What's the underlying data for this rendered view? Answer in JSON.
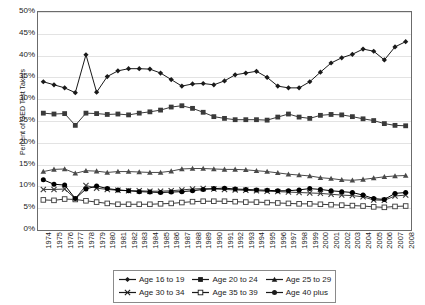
{
  "chart_data": {
    "type": "line",
    "title": "",
    "xlabel": "",
    "ylabel": "Percent of GED Test Takers",
    "ylim": [
      0,
      50
    ],
    "ytick_labels": [
      "50%",
      "45%",
      "40%",
      "35%",
      "30%",
      "25%",
      "20%",
      "15%",
      "10%",
      "5%",
      "0%"
    ],
    "ytick_values": [
      50,
      45,
      40,
      35,
      30,
      25,
      20,
      15,
      10,
      5,
      0
    ],
    "grid": true,
    "legend_position": "bottom",
    "x": [
      1974,
      1975,
      1976,
      1977,
      1978,
      1979,
      1980,
      1981,
      1982,
      1983,
      1984,
      1985,
      1986,
      1987,
      1988,
      1989,
      1990,
      1991,
      1992,
      1993,
      1994,
      1995,
      1996,
      1997,
      1998,
      1999,
      2000,
      2001,
      2002,
      2003,
      2004,
      2005,
      2006,
      2007,
      2008
    ],
    "categories": [
      "1974",
      "1975",
      "1976",
      "1977",
      "1978",
      "1979",
      "1980",
      "1981",
      "1982",
      "1983",
      "1984",
      "1985",
      "1986",
      "1987",
      "1988",
      "1989",
      "1990",
      "1991",
      "1992",
      "1993",
      "1994",
      "1995",
      "1996",
      "1997",
      "1998",
      "1999",
      "2000",
      "2001",
      "2002",
      "2003",
      "2004",
      "2005",
      "2006",
      "2007",
      "2008"
    ],
    "series": [
      {
        "name": "Age 16 to 19",
        "marker": "diamond",
        "color": "#1a1a1a",
        "values": [
          34.0,
          33.3,
          32.6,
          31.5,
          40.2,
          31.6,
          35.2,
          36.5,
          37.0,
          37.0,
          36.9,
          36.0,
          34.5,
          33.0,
          33.5,
          33.6,
          33.3,
          34.2,
          35.6,
          36.0,
          36.4,
          35.0,
          33.0,
          32.6,
          32.6,
          34.0,
          36.2,
          38.3,
          39.5,
          40.3,
          41.5,
          41.0,
          39.0,
          42.0,
          43.2
        ]
      },
      {
        "name": "Age 20 to 24",
        "marker": "square-filled",
        "color": "#3a3a3a",
        "values": [
          26.8,
          26.6,
          26.7,
          24.0,
          26.8,
          26.7,
          26.5,
          26.6,
          26.4,
          26.8,
          27.1,
          27.5,
          28.2,
          28.5,
          27.9,
          27.0,
          26.0,
          25.6,
          25.3,
          25.3,
          25.3,
          25.2,
          25.9,
          26.6,
          25.9,
          25.6,
          26.3,
          26.5,
          26.4,
          26.0,
          25.5,
          25.1,
          24.4,
          24.0,
          23.9
        ]
      },
      {
        "name": "Age 25 to 29",
        "marker": "triangle",
        "color": "#4a4a4a",
        "values": [
          13.4,
          13.9,
          14.0,
          13.0,
          13.6,
          13.5,
          13.2,
          13.4,
          13.4,
          13.3,
          13.2,
          13.2,
          13.5,
          14.0,
          14.1,
          14.1,
          14.0,
          13.9,
          13.9,
          13.8,
          13.6,
          13.4,
          13.1,
          12.8,
          12.6,
          12.4,
          12.0,
          11.8,
          11.5,
          11.4,
          11.6,
          11.9,
          12.2,
          12.4,
          12.5
        ]
      },
      {
        "name": "Age 30 to 34",
        "marker": "x",
        "color": "#3a3a3a",
        "values": [
          9.3,
          9.3,
          9.4,
          7.2,
          10.2,
          9.6,
          9.3,
          9.1,
          9.0,
          9.0,
          8.9,
          8.9,
          9.0,
          9.2,
          9.4,
          9.5,
          9.4,
          9.3,
          9.2,
          9.1,
          9.0,
          8.9,
          8.8,
          8.7,
          8.6,
          8.5,
          8.4,
          8.2,
          8.0,
          7.9,
          7.6,
          6.9,
          6.8,
          7.8,
          8.0
        ]
      },
      {
        "name": "Age 35 to 39",
        "marker": "square-open",
        "color": "#3a3a3a",
        "values": [
          6.9,
          6.8,
          7.1,
          7.0,
          6.7,
          6.4,
          6.1,
          5.9,
          5.9,
          5.9,
          5.9,
          6.0,
          6.1,
          6.3,
          6.5,
          6.6,
          6.6,
          6.6,
          6.5,
          6.4,
          6.4,
          6.3,
          6.2,
          6.1,
          6.0,
          6.0,
          5.9,
          5.8,
          5.7,
          5.6,
          5.5,
          5.3,
          5.2,
          5.4,
          5.5
        ]
      },
      {
        "name": "Age 40 plus",
        "marker": "circle",
        "color": "#000000",
        "values": [
          11.5,
          10.5,
          10.3,
          7.2,
          9.4,
          10.1,
          9.5,
          9.2,
          9.0,
          8.8,
          8.7,
          8.6,
          8.7,
          8.8,
          9.0,
          9.3,
          9.5,
          9.6,
          9.4,
          9.3,
          9.2,
          9.1,
          9.0,
          9.0,
          9.2,
          9.5,
          9.3,
          9.0,
          8.8,
          8.6,
          8.0,
          7.2,
          7.0,
          8.4,
          8.6
        ]
      }
    ]
  },
  "legend": {
    "rows": [
      [
        {
          "label": "Age 16 to 19",
          "marker": "diamond"
        },
        {
          "label": "Age 20 to 24",
          "marker": "square-filled"
        },
        {
          "label": "Age 25 to 29",
          "marker": "triangle"
        }
      ],
      [
        {
          "label": "Age 30 to 34",
          "marker": "x"
        },
        {
          "label": "Age 35 to 39",
          "marker": "square-open"
        },
        {
          "label": "Age 40 plus",
          "marker": "circle"
        }
      ]
    ]
  }
}
